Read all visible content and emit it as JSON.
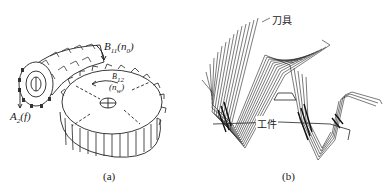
{
  "figure": {
    "panel_a": {
      "caption": "(a)",
      "labels": {
        "hob_rotation": {
          "main": "B",
          "sub": "11",
          "paren_main": "n",
          "paren_sub": "0"
        },
        "gear_rotation": {
          "main": "B",
          "sub": "12",
          "paren_main": "n",
          "paren_sub": "w"
        },
        "feed": {
          "main": "A",
          "sub": "2",
          "paren": "f"
        }
      },
      "description": "Hob cutter meshing with gear workpiece"
    },
    "panel_b": {
      "caption": "(b)",
      "labels": {
        "tool": "刀具",
        "workpiece": "工件"
      },
      "description": "Envelope of successive tool positions generating tooth profile"
    }
  }
}
